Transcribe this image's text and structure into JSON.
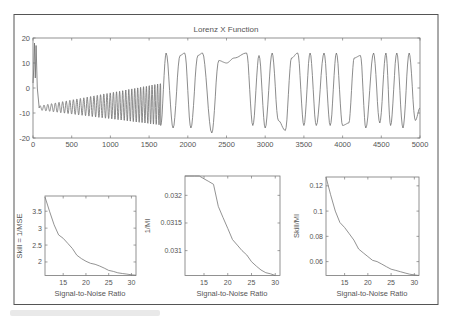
{
  "figure": {
    "frame_color": "#555555",
    "line_color": "#6e6e6e",
    "background": "#ffffff"
  },
  "chart_data": [
    {
      "type": "line",
      "title": "Lorenz X Function",
      "xlabel": "",
      "ylabel": "",
      "xlim": [
        0,
        5000
      ],
      "ylim": [
        -20,
        20
      ],
      "xticks": [
        0,
        500,
        1000,
        1500,
        2000,
        2500,
        3000,
        3500,
        4000,
        4500,
        5000
      ],
      "yticks": [
        -20,
        -10,
        0,
        10,
        20
      ],
      "grid": false,
      "legend": null,
      "description": "Lorenz attractor x-component time series: initial spike to ~18 near t=20-40, then growing oscillation around -8 (amplitude rising from ~1 to ~8) up to t~1650, followed by chaotic switching between lobes with peaks near +14/+15 and troughs near -16/-18.",
      "key_points": {
        "x": [
          0,
          20,
          40,
          80,
          200,
          500,
          800,
          1000,
          1200,
          1400,
          1550,
          1650,
          1720,
          1810,
          1900,
          1960,
          2040,
          2130,
          2190,
          2310,
          2400,
          2500,
          2600,
          2760,
          2840,
          2920,
          3000,
          3090,
          3170,
          3260,
          3340,
          3420,
          3500,
          3580,
          3660,
          3760,
          3840,
          3920,
          4000,
          4080,
          4150,
          4230,
          4300,
          4400,
          4480,
          4560,
          4620,
          4700,
          4780,
          4860,
          4940,
          5000
        ],
        "y": [
          2,
          18,
          0,
          -8,
          -9,
          -8,
          -7,
          -7,
          -6,
          -5,
          -13,
          -15,
          14,
          -16,
          13,
          14,
          -16,
          13,
          14,
          -18,
          11,
          10,
          12,
          14,
          -15,
          13,
          -16,
          14,
          -13,
          -17,
          12,
          14,
          -15,
          14,
          -15,
          14,
          -15,
          14,
          -15,
          -14,
          12,
          13,
          -16,
          14,
          -14,
          14,
          -15,
          14,
          -16,
          14,
          -13,
          -8
        ]
      }
    },
    {
      "type": "line",
      "title": "",
      "xlabel": "Signal-to-Noise Ratio",
      "ylabel": "Skill = 1/MSE",
      "xlim": [
        11,
        31
      ],
      "ylim": [
        1.6,
        3.95
      ],
      "xticks": [
        15,
        20,
        25,
        30
      ],
      "yticks": [
        2,
        2.5,
        3,
        3.5
      ],
      "grid": false,
      "x": [
        11,
        12,
        13,
        14,
        15,
        16,
        17,
        18,
        19,
        20,
        21,
        22,
        23,
        24,
        25,
        26,
        27,
        28,
        29,
        30,
        31
      ],
      "y": [
        3.92,
        3.5,
        3.1,
        2.8,
        2.7,
        2.55,
        2.4,
        2.2,
        2.1,
        2.02,
        1.96,
        1.93,
        1.88,
        1.82,
        1.75,
        1.72,
        1.68,
        1.66,
        1.64,
        1.62,
        1.61
      ]
    },
    {
      "type": "line",
      "title": "",
      "xlabel": "Signal-to-Noise Ratio",
      "ylabel": "1/MI",
      "xlim": [
        11,
        31
      ],
      "ylim": [
        0.03055,
        0.03235
      ],
      "xticks": [
        15,
        20,
        25,
        30
      ],
      "yticks": [
        0.031,
        0.0315,
        0.032
      ],
      "ytick_labels": [
        "0.031",
        "0.0315",
        "0.032"
      ],
      "grid": false,
      "x": [
        11,
        12,
        13,
        14,
        15,
        16,
        17,
        18,
        19,
        20,
        21,
        22,
        23,
        24,
        25,
        26,
        27,
        28,
        29,
        30
      ],
      "y": [
        0.03235,
        0.03235,
        0.03235,
        0.03235,
        0.0323,
        0.03225,
        0.0322,
        0.0318,
        0.0316,
        0.0314,
        0.0312,
        0.0311,
        0.031,
        0.03092,
        0.0308,
        0.03072,
        0.03065,
        0.0306,
        0.03058,
        0.03055
      ]
    },
    {
      "type": "line",
      "title": "",
      "xlabel": "Signal-to-Noise Ratio",
      "ylabel": "Skill/MI",
      "xlim": [
        11,
        31
      ],
      "ylim": [
        0.049,
        0.127
      ],
      "xticks": [
        15,
        20,
        25,
        30
      ],
      "yticks": [
        0.06,
        0.08,
        0.1,
        0.12
      ],
      "grid": false,
      "x": [
        11,
        12,
        13,
        14,
        15,
        16,
        17,
        18,
        19,
        20,
        21,
        22,
        23,
        24,
        25,
        26,
        27,
        28,
        29,
        30,
        31
      ],
      "y": [
        0.127,
        0.113,
        0.1,
        0.091,
        0.087,
        0.082,
        0.077,
        0.07,
        0.067,
        0.064,
        0.061,
        0.06,
        0.058,
        0.056,
        0.054,
        0.053,
        0.052,
        0.051,
        0.05,
        0.0495,
        0.049
      ]
    }
  ],
  "labels": {
    "top_title": "Lorenz X Function",
    "top_xticks": [
      "0",
      "500",
      "1000",
      "1500",
      "2000",
      "2500",
      "3000",
      "3500",
      "4000",
      "4500",
      "5000"
    ],
    "top_yticks": [
      "20",
      "10",
      "0",
      "-10",
      "-20"
    ],
    "sub1_ylabel": "Skill = 1/MSE",
    "sub1_yticks": [
      "3.5",
      "3",
      "2.5",
      "2"
    ],
    "sub2_ylabel": "1/MI",
    "sub2_yticks": [
      "0.032",
      "0.0315",
      "0.031"
    ],
    "sub3_ylabel": "Skill/MI",
    "sub3_yticks": [
      "0.12",
      "0.1",
      "0.08",
      "0.06"
    ],
    "sub_xticks": [
      "15",
      "20",
      "25",
      "30"
    ],
    "sub_xlabel": "Signal-to-Noise Ratio"
  }
}
